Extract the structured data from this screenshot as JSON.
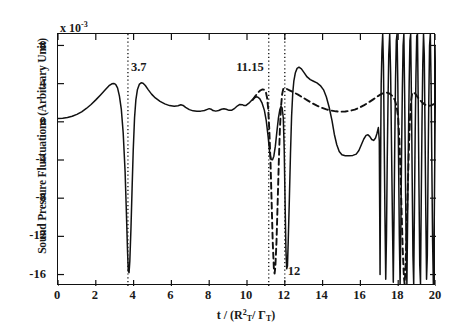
{
  "chart_data": {
    "type": "line",
    "title": "",
    "xlabel": "t / (R²_T / Γ_T)",
    "xlabel_parts": {
      "pre": "t / (R",
      "sup": "2",
      "sub1": "T",
      "mid": "/ ",
      "gamma": "Γ",
      "sub2": "T",
      "post": ")"
    },
    "ylabel": "Sound Pressure Fluctuations (Arbitrary Unit)",
    "y_exponent_label": "x 10",
    "y_exponent_power": "-3",
    "xlim": [
      0,
      20
    ],
    "ylim": [
      -17.2,
      9.2
    ],
    "xticks": [
      0,
      2,
      4,
      6,
      8,
      10,
      12,
      14,
      16,
      18,
      20
    ],
    "yticks": [
      8,
      4,
      0,
      -4,
      -8,
      -12,
      -16
    ],
    "grid": false,
    "legend": "none",
    "annotations": [
      {
        "label": "3.7",
        "x": 3.7,
        "y": 6.4,
        "vline": true,
        "align": "left"
      },
      {
        "label": "11.15",
        "x": 11.15,
        "y": 6.4,
        "vline": true,
        "align": "right"
      },
      {
        "label": "12",
        "x": 12.0,
        "y": -15.0,
        "vline": true,
        "align": "left"
      }
    ],
    "vlines": [
      3.7,
      11.15,
      12.0
    ],
    "series": [
      {
        "name": "solid",
        "style": "solid",
        "color": "#111111",
        "points": [
          [
            0.0,
            0.35
          ],
          [
            0.25,
            0.38
          ],
          [
            0.5,
            0.45
          ],
          [
            0.75,
            0.58
          ],
          [
            1.0,
            0.78
          ],
          [
            1.25,
            1.05
          ],
          [
            1.5,
            1.4
          ],
          [
            1.75,
            1.82
          ],
          [
            2.0,
            2.3
          ],
          [
            2.25,
            2.82
          ],
          [
            2.5,
            3.35
          ],
          [
            2.7,
            3.78
          ],
          [
            2.85,
            3.98
          ],
          [
            2.95,
            4.02
          ],
          [
            3.05,
            3.92
          ],
          [
            3.15,
            3.55
          ],
          [
            3.25,
            2.7
          ],
          [
            3.35,
            1.3
          ],
          [
            3.45,
            -1.2
          ],
          [
            3.55,
            -5.2
          ],
          [
            3.62,
            -9.6
          ],
          [
            3.68,
            -13.6
          ],
          [
            3.72,
            -15.65
          ],
          [
            3.76,
            -15.8
          ],
          [
            3.8,
            -14.6
          ],
          [
            3.86,
            -11.2
          ],
          [
            3.92,
            -7.0
          ],
          [
            3.98,
            -3.0
          ],
          [
            4.05,
            0.4
          ],
          [
            4.12,
            2.3
          ],
          [
            4.2,
            3.35
          ],
          [
            4.3,
            3.92
          ],
          [
            4.4,
            4.1
          ],
          [
            4.5,
            4.05
          ],
          [
            4.62,
            3.8
          ],
          [
            4.78,
            3.35
          ],
          [
            4.95,
            2.9
          ],
          [
            5.15,
            2.5
          ],
          [
            5.4,
            2.15
          ],
          [
            5.65,
            1.88
          ],
          [
            5.9,
            1.7
          ],
          [
            6.15,
            1.62
          ],
          [
            6.35,
            1.68
          ],
          [
            6.5,
            1.78
          ],
          [
            6.62,
            1.72
          ],
          [
            6.75,
            1.52
          ],
          [
            6.95,
            1.28
          ],
          [
            7.15,
            1.15
          ],
          [
            7.35,
            1.1
          ],
          [
            7.55,
            1.12
          ],
          [
            7.75,
            1.18
          ],
          [
            7.9,
            1.3
          ],
          [
            8.0,
            1.38
          ],
          [
            8.1,
            1.32
          ],
          [
            8.2,
            1.18
          ],
          [
            8.35,
            1.12
          ],
          [
            8.5,
            1.18
          ],
          [
            8.65,
            1.32
          ],
          [
            8.78,
            1.38
          ],
          [
            8.9,
            1.32
          ],
          [
            9.05,
            1.2
          ],
          [
            9.2,
            1.22
          ],
          [
            9.35,
            1.42
          ],
          [
            9.5,
            1.68
          ],
          [
            9.62,
            1.82
          ],
          [
            9.75,
            1.8
          ],
          [
            9.85,
            1.7
          ],
          [
            9.95,
            1.72
          ],
          [
            10.1,
            1.95
          ],
          [
            10.25,
            2.25
          ],
          [
            10.4,
            2.52
          ],
          [
            10.5,
            2.62
          ],
          [
            10.58,
            2.58
          ],
          [
            10.68,
            2.4
          ],
          [
            10.8,
            1.95
          ],
          [
            10.92,
            1.2
          ],
          [
            11.02,
            0.1
          ],
          [
            11.12,
            -1.6
          ],
          [
            11.2,
            -3.2
          ],
          [
            11.28,
            -3.95
          ],
          [
            11.35,
            -3.98
          ],
          [
            11.42,
            -3.6
          ],
          [
            11.5,
            -2.55
          ],
          [
            11.58,
            -1.05
          ],
          [
            11.66,
            0.35
          ],
          [
            11.74,
            1.3
          ],
          [
            11.8,
            1.62
          ],
          [
            11.86,
            1.45
          ],
          [
            11.92,
            0.4
          ],
          [
            11.97,
            -3.0
          ],
          [
            12.02,
            -9.0
          ],
          [
            12.06,
            -13.4
          ],
          [
            12.1,
            -15.4
          ],
          [
            12.14,
            -15.1
          ],
          [
            12.18,
            -12.6
          ],
          [
            12.24,
            -8.2
          ],
          [
            12.3,
            -3.4
          ],
          [
            12.36,
            0.6
          ],
          [
            12.42,
            3.0
          ],
          [
            12.48,
            4.3
          ],
          [
            12.56,
            5.15
          ],
          [
            12.65,
            5.6
          ],
          [
            12.75,
            5.72
          ],
          [
            12.88,
            5.55
          ],
          [
            13.02,
            5.15
          ],
          [
            13.18,
            4.7
          ],
          [
            13.35,
            4.42
          ],
          [
            13.52,
            4.25
          ],
          [
            13.7,
            4.08
          ],
          [
            13.88,
            3.8
          ],
          [
            14.05,
            3.35
          ],
          [
            14.2,
            2.6
          ],
          [
            14.35,
            1.5
          ],
          [
            14.5,
            0.1
          ],
          [
            14.62,
            -1.3
          ],
          [
            14.75,
            -2.4
          ],
          [
            14.88,
            -3.1
          ],
          [
            15.02,
            -3.45
          ],
          [
            15.2,
            -3.55
          ],
          [
            15.4,
            -3.55
          ],
          [
            15.6,
            -3.52
          ],
          [
            15.78,
            -3.38
          ],
          [
            15.92,
            -3.0
          ],
          [
            16.05,
            -2.4
          ],
          [
            16.18,
            -1.8
          ],
          [
            16.3,
            -1.42
          ],
          [
            16.4,
            -1.35
          ],
          [
            16.5,
            -1.55
          ],
          [
            16.6,
            -1.85
          ],
          [
            16.7,
            -1.95
          ],
          [
            16.8,
            -1.7
          ],
          [
            16.88,
            -1.2
          ],
          [
            16.95,
            -0.6
          ],
          [
            17.0,
            -2.0
          ],
          [
            17.02,
            -9.0
          ],
          [
            17.04,
            -16.0
          ],
          [
            17.06,
            -9.0
          ],
          [
            17.08,
            -1.0
          ],
          [
            17.1,
            4.0
          ],
          [
            17.14,
            7.5
          ],
          [
            17.18,
            9.2
          ],
          [
            17.22,
            6.0
          ],
          [
            17.26,
            -2.0
          ],
          [
            17.3,
            -10.0
          ],
          [
            17.34,
            -16.5
          ],
          [
            17.38,
            -12.0
          ],
          [
            17.42,
            -4.0
          ],
          [
            17.46,
            2.0
          ],
          [
            17.5,
            7.0
          ],
          [
            17.55,
            9.2
          ],
          [
            17.6,
            5.0
          ],
          [
            17.65,
            -3.0
          ],
          [
            17.7,
            -11.0
          ],
          [
            17.74,
            -16.8
          ],
          [
            17.78,
            -10.0
          ],
          [
            17.82,
            -2.0
          ],
          [
            17.86,
            4.5
          ],
          [
            17.9,
            8.5
          ],
          [
            17.94,
            9.2
          ],
          [
            17.98,
            4.0
          ],
          [
            18.02,
            -4.0
          ],
          [
            18.06,
            -12.0
          ],
          [
            18.1,
            -17.0
          ],
          [
            18.14,
            -11.0
          ],
          [
            18.18,
            -3.0
          ],
          [
            18.22,
            3.5
          ],
          [
            18.26,
            8.0
          ],
          [
            18.3,
            9.2
          ],
          [
            18.34,
            3.0
          ],
          [
            18.38,
            -5.0
          ],
          [
            18.42,
            -13.0
          ],
          [
            18.46,
            -17.0
          ],
          [
            18.5,
            -10.0
          ],
          [
            18.54,
            -2.0
          ],
          [
            18.58,
            4.0
          ],
          [
            18.62,
            8.5
          ],
          [
            18.66,
            9.2
          ],
          [
            18.7,
            2.5
          ],
          [
            18.74,
            -6.0
          ],
          [
            18.78,
            -14.0
          ],
          [
            18.82,
            -17.0
          ],
          [
            18.86,
            -9.0
          ],
          [
            18.9,
            -1.0
          ],
          [
            18.94,
            5.0
          ],
          [
            18.98,
            9.0
          ],
          [
            19.02,
            9.2
          ],
          [
            19.06,
            2.0
          ],
          [
            19.1,
            -7.0
          ],
          [
            19.14,
            -15.0
          ],
          [
            19.18,
            -17.0
          ],
          [
            19.22,
            -8.0
          ],
          [
            19.26,
            0.0
          ],
          [
            19.3,
            6.0
          ],
          [
            19.34,
            9.2
          ],
          [
            19.38,
            7.0
          ],
          [
            19.42,
            -1.0
          ],
          [
            19.46,
            -9.5
          ],
          [
            19.5,
            -16.5
          ],
          [
            19.54,
            -14.0
          ],
          [
            19.58,
            -5.0
          ],
          [
            19.62,
            2.5
          ],
          [
            19.66,
            8.0
          ],
          [
            19.7,
            9.2
          ],
          [
            19.74,
            4.0
          ],
          [
            19.78,
            -4.5
          ],
          [
            19.82,
            -12.5
          ],
          [
            19.86,
            -17.0
          ],
          [
            19.9,
            -12.0
          ],
          [
            19.94,
            -3.0
          ],
          [
            19.97,
            4.0
          ],
          [
            20.0,
            8.0
          ]
        ]
      },
      {
        "name": "dashed",
        "style": "dashed",
        "color": "#111111",
        "points": [
          [
            10.3,
            2.3
          ],
          [
            10.45,
            2.72
          ],
          [
            10.58,
            3.05
          ],
          [
            10.7,
            3.28
          ],
          [
            10.82,
            3.4
          ],
          [
            10.92,
            3.35
          ],
          [
            11.0,
            3.1
          ],
          [
            11.06,
            2.55
          ],
          [
            11.12,
            1.4
          ],
          [
            11.18,
            -0.8
          ],
          [
            11.24,
            -4.0
          ],
          [
            11.3,
            -8.2
          ],
          [
            11.36,
            -12.5
          ],
          [
            11.42,
            -15.3
          ],
          [
            11.46,
            -15.9
          ],
          [
            11.5,
            -15.2
          ],
          [
            11.56,
            -12.6
          ],
          [
            11.62,
            -8.6
          ],
          [
            11.68,
            -4.4
          ],
          [
            11.74,
            -0.8
          ],
          [
            11.8,
            1.6
          ],
          [
            11.86,
            2.9
          ],
          [
            11.92,
            3.45
          ],
          [
            12.0,
            3.52
          ],
          [
            12.1,
            3.45
          ],
          [
            12.25,
            3.3
          ],
          [
            12.45,
            3.1
          ],
          [
            12.7,
            2.85
          ],
          [
            12.95,
            2.55
          ],
          [
            13.2,
            2.25
          ],
          [
            13.45,
            1.95
          ],
          [
            13.7,
            1.7
          ],
          [
            13.95,
            1.48
          ],
          [
            14.2,
            1.3
          ],
          [
            14.45,
            1.18
          ],
          [
            14.7,
            1.1
          ],
          [
            14.95,
            1.06
          ],
          [
            15.2,
            1.08
          ],
          [
            15.45,
            1.15
          ],
          [
            15.7,
            1.28
          ],
          [
            15.95,
            1.48
          ],
          [
            16.2,
            1.75
          ],
          [
            16.45,
            2.05
          ],
          [
            16.7,
            2.38
          ],
          [
            16.95,
            2.72
          ],
          [
            17.1,
            2.9
          ],
          [
            17.25,
            3.02
          ],
          [
            17.4,
            3.05
          ],
          [
            17.55,
            2.95
          ],
          [
            17.7,
            2.7
          ],
          [
            17.82,
            2.3
          ],
          [
            17.92,
            1.6
          ],
          [
            18.0,
            0.4
          ],
          [
            18.06,
            -1.8
          ],
          [
            18.12,
            -5.2
          ],
          [
            18.18,
            -9.4
          ],
          [
            18.24,
            -13.4
          ],
          [
            18.3,
            -16.2
          ],
          [
            18.34,
            -17.0
          ],
          [
            18.38,
            -15.6
          ],
          [
            18.44,
            -11.8
          ],
          [
            18.5,
            -7.4
          ],
          [
            18.56,
            -3.2
          ],
          [
            18.62,
            0.2
          ],
          [
            18.68,
            2.2
          ],
          [
            18.74,
            3.0
          ],
          [
            18.82,
            3.1
          ],
          [
            18.92,
            2.9
          ],
          [
            19.02,
            2.6
          ],
          [
            19.14,
            2.3
          ],
          [
            19.26,
            2.05
          ],
          [
            19.38,
            1.85
          ],
          [
            19.5,
            1.72
          ],
          [
            19.62,
            1.68
          ],
          [
            19.74,
            1.72
          ],
          [
            19.86,
            1.82
          ],
          [
            20.0,
            2.0
          ]
        ]
      }
    ]
  }
}
